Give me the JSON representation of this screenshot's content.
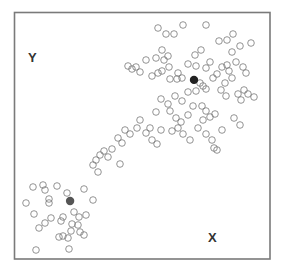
{
  "chart_data": {
    "type": "scatter",
    "title": "",
    "xlabel": "X",
    "ylabel": "Y",
    "xlim": [
      0,
      100
    ],
    "ylim": [
      0,
      100
    ],
    "grid": false,
    "legend": null,
    "frame": {
      "left": 14,
      "top": 12,
      "right": 270,
      "bottom": 259
    },
    "marker": {
      "radius": 3.3,
      "stroke": "#777777",
      "fill": "none",
      "stroke_width": 0.8
    },
    "series": [
      {
        "name": "cluster-1",
        "centroid": {
          "x": 70.3,
          "y": 72.5,
          "color": "#222222"
        },
        "points_px": [
          [
            158,
            28
          ],
          [
            166,
            34
          ],
          [
            174,
            34
          ],
          [
            183,
            25
          ],
          [
            206,
            25
          ],
          [
            219,
            41
          ],
          [
            227,
            40
          ],
          [
            233,
            34
          ],
          [
            240,
            46
          ],
          [
            251,
            43
          ],
          [
            232,
            52
          ],
          [
            128,
            66
          ],
          [
            132,
            69
          ],
          [
            136,
            67
          ],
          [
            140,
            72
          ],
          [
            146,
            60
          ],
          [
            156,
            58
          ],
          [
            162,
            50
          ],
          [
            168,
            56
          ],
          [
            164,
            60
          ],
          [
            169,
            67
          ],
          [
            162,
            71
          ],
          [
            158,
            73
          ],
          [
            152,
            76
          ],
          [
            170,
            79
          ],
          [
            177,
            79
          ],
          [
            182,
            78
          ],
          [
            178,
            73
          ],
          [
            188,
            64
          ],
          [
            195,
            55
          ],
          [
            201,
            50
          ],
          [
            196,
            66
          ],
          [
            206,
            68
          ],
          [
            210,
            62
          ],
          [
            213,
            78
          ],
          [
            217,
            74
          ],
          [
            222,
            67
          ],
          [
            227,
            65
          ],
          [
            229,
            71
          ],
          [
            236,
            62
          ],
          [
            243,
            67
          ],
          [
            246,
            73
          ],
          [
            232,
            78
          ],
          [
            225,
            83
          ],
          [
            221,
            90
          ],
          [
            226,
            96
          ],
          [
            238,
            94
          ],
          [
            244,
            90
          ],
          [
            248,
            94
          ],
          [
            254,
            97
          ],
          [
            241,
            100
          ],
          [
            203,
            86
          ],
          [
            206,
            89
          ],
          [
            200,
            83
          ],
          [
            196,
            91
          ],
          [
            188,
            92
          ],
          [
            175,
            96
          ],
          [
            182,
            101
          ],
          [
            168,
            104
          ],
          [
            161,
            99
          ],
          [
            156,
            112
          ],
          [
            170,
            111
          ],
          [
            176,
            118
          ],
          [
            181,
            122
          ],
          [
            188,
            115
          ],
          [
            193,
            106
          ],
          [
            202,
            106
          ],
          [
            206,
            111
          ],
          [
            210,
            117
          ],
          [
            215,
            114
          ],
          [
            203,
            120
          ],
          [
            198,
            128
          ],
          [
            206,
            134
          ],
          [
            212,
            140
          ],
          [
            214,
            148
          ],
          [
            217,
            150
          ],
          [
            234,
            118
          ],
          [
            240,
            125
          ],
          [
            222,
            130
          ],
          [
            150,
            128
          ],
          [
            146,
            133
          ],
          [
            152,
            140
          ],
          [
            157,
            144
          ],
          [
            161,
            130
          ],
          [
            172,
            131
          ],
          [
            178,
            128
          ],
          [
            183,
            134
          ],
          [
            190,
            140
          ],
          [
            140,
            120
          ],
          [
            137,
            128
          ],
          [
            130,
            134
          ],
          [
            125,
            130
          ],
          [
            118,
            138
          ],
          [
            122,
            143
          ],
          [
            112,
            149
          ],
          [
            104,
            151
          ],
          [
            108,
            157
          ],
          [
            100,
            155
          ],
          [
            96,
            160
          ],
          [
            93,
            165
          ],
          [
            98,
            172
          ],
          [
            120,
            164
          ]
        ]
      },
      {
        "name": "cluster-2",
        "centroid": {
          "x": 21.9,
          "y": 23.5,
          "color": "#555555"
        },
        "points_px": [
          [
            33,
            187
          ],
          [
            43,
            185
          ],
          [
            45,
            190
          ],
          [
            57,
            186
          ],
          [
            67,
            193
          ],
          [
            84,
            189
          ],
          [
            93,
            200
          ],
          [
            49,
            199
          ],
          [
            49,
            203
          ],
          [
            26,
            203
          ],
          [
            34,
            214
          ],
          [
            51,
            218
          ],
          [
            45,
            223
          ],
          [
            39,
            228
          ],
          [
            63,
            217
          ],
          [
            61,
            221
          ],
          [
            74,
            212
          ],
          [
            79,
            217
          ],
          [
            72,
            224
          ],
          [
            71,
            231
          ],
          [
            78,
            225
          ],
          [
            86,
            215
          ],
          [
            59,
            237
          ],
          [
            63,
            236
          ],
          [
            68,
            238
          ],
          [
            80,
            232
          ],
          [
            84,
            235
          ],
          [
            36,
            250
          ],
          [
            69,
            249
          ]
        ]
      }
    ]
  },
  "labels": {
    "x_axis": "X",
    "y_axis": "Y"
  }
}
